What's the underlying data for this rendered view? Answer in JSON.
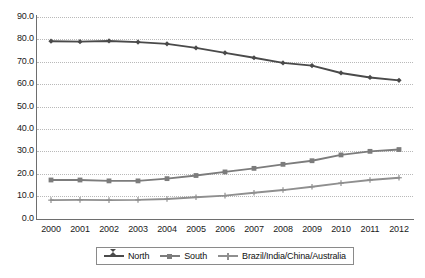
{
  "chart_data": {
    "type": "line",
    "title": "",
    "subtitle": "",
    "xlabel": "",
    "ylabel": "",
    "categories": [
      "2000",
      "2001",
      "2002",
      "2003",
      "2004",
      "2005",
      "2006",
      "2007",
      "2008",
      "2009",
      "2010",
      "2011",
      "2012"
    ],
    "x": [
      2000,
      2001,
      2002,
      2003,
      2004,
      2005,
      2006,
      2007,
      2008,
      2009,
      2010,
      2011,
      2012
    ],
    "ylim": [
      0.0,
      90.0
    ],
    "ytick_step": 10.0,
    "yticks": [
      "90.0",
      "80.0",
      "70.0",
      "60.0",
      "50.0",
      "40.0",
      "30.0",
      "20.0",
      "10.0",
      "0.0"
    ],
    "ytick_values": [
      90.0,
      80.0,
      70.0,
      60.0,
      50.0,
      40.0,
      30.0,
      20.0,
      10.0,
      0.0
    ],
    "grid": "horizontal-dotted",
    "legend_position": "bottom-center",
    "series": [
      {
        "name": "North",
        "marker": "diamond",
        "color": "#4a4a4a",
        "values": [
          79.2,
          79.0,
          79.3,
          78.8,
          78.0,
          76.2,
          74.0,
          71.8,
          69.5,
          68.3,
          65.0,
          63.0,
          61.7
        ]
      },
      {
        "name": "South",
        "marker": "square",
        "color": "#7c7c7c",
        "values": [
          17.2,
          17.2,
          16.8,
          16.8,
          17.8,
          19.2,
          20.8,
          22.4,
          24.2,
          25.8,
          28.4,
          30.0,
          30.8
        ]
      },
      {
        "name": "Brazil/India/China/Australia",
        "marker": "plus",
        "color": "#8f8f8f",
        "values": [
          8.2,
          8.3,
          8.2,
          8.3,
          8.7,
          9.5,
          10.2,
          11.5,
          12.7,
          14.2,
          15.8,
          17.2,
          18.2
        ]
      }
    ]
  },
  "colors": {
    "axis": "#6e6e6e",
    "grid": "#b9b9b9",
    "background": "#ffffff",
    "text": "#1a1a1a",
    "legend_border": "#8a8a8a"
  }
}
